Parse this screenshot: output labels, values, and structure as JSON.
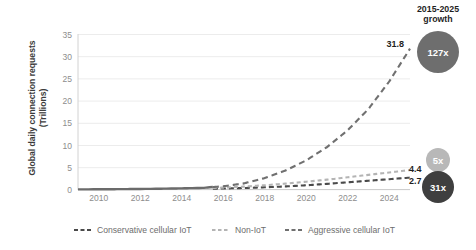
{
  "chart_data": {
    "type": "line",
    "title": "",
    "xlabel": "",
    "ylabel": "Global daily connection requests (Trillions)",
    "ylabel_line1": "Global daily connection requests",
    "ylabel_line2": "(Trillions)",
    "xlim": [
      2009,
      2025
    ],
    "ylim": [
      0,
      35
    ],
    "yticks": [
      0,
      5,
      10,
      15,
      20,
      25,
      30,
      35
    ],
    "xticks": [
      2010,
      2012,
      2014,
      2016,
      2018,
      2020,
      2022,
      2024
    ],
    "grid": true,
    "grid_axis": "y",
    "legend_position": "bottom",
    "x": [
      2009,
      2010,
      2011,
      2012,
      2013,
      2014,
      2015,
      2016,
      2017,
      2018,
      2019,
      2020,
      2021,
      2022,
      2023,
      2024,
      2025
    ],
    "history_end_year": 2015.5,
    "series": [
      {
        "name": "Conservative cellular IoT",
        "color": "#4a4a4a",
        "dash": "5,3",
        "end_label": "2.7",
        "values": [
          0.05,
          0.06,
          0.07,
          0.09,
          0.11,
          0.14,
          0.18,
          0.25,
          0.36,
          0.52,
          0.72,
          0.98,
          1.3,
          1.65,
          2.0,
          2.35,
          2.7
        ]
      },
      {
        "name": "Non-IoT",
        "color": "#b4b4b4",
        "dash": "4,3",
        "end_label": "4.4",
        "values": [
          0.05,
          0.07,
          0.09,
          0.12,
          0.16,
          0.22,
          0.3,
          0.45,
          0.68,
          0.98,
          1.35,
          1.78,
          2.25,
          2.78,
          3.33,
          3.87,
          4.4
        ]
      },
      {
        "name": "Aggressive cellular IoT",
        "color": "#707070",
        "dash": "6,4",
        "end_label": "31.8",
        "values": [
          0.05,
          0.07,
          0.1,
          0.14,
          0.2,
          0.28,
          0.4,
          0.75,
          1.4,
          2.6,
          4.3,
          6.6,
          9.6,
          13.4,
          18.2,
          24.4,
          31.8
        ]
      }
    ],
    "legend": [
      {
        "label": "Conservative cellular IoT",
        "color": "#4a4a4a",
        "dash": "4,2.5"
      },
      {
        "label": "Non-IoT",
        "color": "#b4b4b4",
        "dash": "3.5,2.5"
      },
      {
        "label": "Aggressive cellular IoT",
        "color": "#707070",
        "dash": "4,2.5"
      }
    ],
    "annotations": [
      {
        "name": "aggressive-end-value",
        "text": "31.8"
      },
      {
        "name": "noniot-end-value",
        "text": "4.4"
      },
      {
        "name": "conservative-end-value",
        "text": "2.7"
      }
    ]
  },
  "growth_panel": {
    "title_line1": "2015-2025",
    "title_line2": "growth",
    "badges": [
      {
        "name": "aggressive",
        "text": "127x",
        "color": "#6e6e6e",
        "radius": 21
      },
      {
        "name": "noniot",
        "text": "5x",
        "color": "#b8b8b8",
        "radius": 12
      },
      {
        "name": "conservative",
        "text": "31x",
        "color": "#3f3f3f",
        "radius": 16
      }
    ]
  }
}
